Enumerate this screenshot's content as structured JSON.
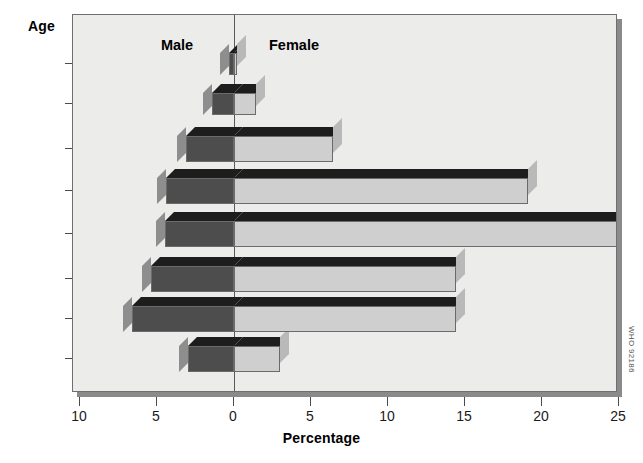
{
  "chart_data": {
    "type": "bar",
    "subtype": "population-pyramid",
    "title": "",
    "xlabel": "Percentage",
    "ylabel": "Age",
    "categories": [
      "5–9",
      "10–14",
      "15–19",
      "20–29",
      "30–39",
      "40–49",
      "50–59",
      "60+"
    ],
    "series": [
      {
        "name": "Male",
        "side": "left",
        "values": [
          3.0,
          6.6,
          5.4,
          4.5,
          4.4,
          3.1,
          1.4,
          0.3
        ]
      },
      {
        "name": "Female",
        "side": "right",
        "values": [
          3.0,
          14.4,
          14.4,
          25.0,
          19.1,
          6.4,
          1.4,
          0.2
        ]
      }
    ],
    "xlim_left": [
      0,
      10
    ],
    "xlim_right": [
      0,
      25
    ],
    "xticks_left": [
      "10",
      "5",
      "0"
    ],
    "xticks_right": [
      "5",
      "10",
      "15",
      "20",
      "25"
    ],
    "xtick_values_left": [
      10,
      5,
      0
    ],
    "xtick_values_right": [
      5,
      10,
      15,
      20,
      25
    ],
    "grid": false,
    "legend_position": "in-plot-top",
    "colors": {
      "male_face": "#4d4d4d",
      "female_face": "#cfcfcf",
      "bar_top": "#1d1d1d",
      "plot_background": "#ececeb",
      "frame": "#6f6f6f"
    }
  },
  "axes": {
    "y_title": "Age",
    "x_title": "Percentage",
    "y_tick_labels": [
      "60+",
      "50–59",
      "40–49",
      "30–39",
      "20–29",
      "15–19",
      "10–14",
      "5–9"
    ],
    "x_tick_labels": [
      "10",
      "5",
      "0",
      "5",
      "10",
      "15",
      "20",
      "25"
    ]
  },
  "series_labels": {
    "male": "Male",
    "female": "Female"
  },
  "footer": {
    "source_code": "WHO 92186"
  }
}
